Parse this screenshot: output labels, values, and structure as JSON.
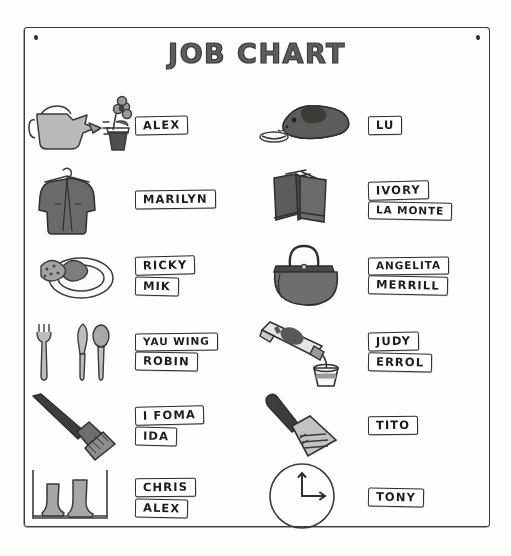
{
  "poster": {
    "title": "JOB CHART",
    "tack_left": "push-pin",
    "tack_right": "push-pin"
  },
  "rows": [
    {
      "side": "left",
      "job_icon": "watering-can-plant-icon",
      "job": "Water the plants",
      "names": [
        "ALEX"
      ]
    },
    {
      "side": "right",
      "job_icon": "guinea-pig-bowl-icon",
      "job": "Feed the class pet",
      "names": [
        "LU"
      ]
    },
    {
      "side": "left",
      "job_icon": "coat-hanger-icon",
      "job": "Coats and closet",
      "names": [
        "MARILYN"
      ]
    },
    {
      "side": "right",
      "job_icon": "books-icon",
      "job": "Library books",
      "names": [
        "IVORY",
        "LA MONTE"
      ]
    },
    {
      "side": "left",
      "job_icon": "plate-cookies-icon",
      "job": "Snack plates",
      "names": [
        "RICKY",
        "MIK"
      ]
    },
    {
      "side": "right",
      "job_icon": "handbag-icon",
      "job": "Dress-up corner",
      "names": [
        "ANGELITA",
        "MERRILL"
      ]
    },
    {
      "side": "left",
      "job_icon": "fork-knife-spoon-icon",
      "job": "Set the table",
      "names": [
        "YAU WING",
        "ROBIN"
      ]
    },
    {
      "side": "right",
      "job_icon": "paint-tube-cup-icon",
      "job": "Paint pots",
      "names": [
        "JUDY",
        "ERROL"
      ]
    },
    {
      "side": "left",
      "job_icon": "broom-icon",
      "job": "Sweeping",
      "names": [
        "I FOMA",
        "IDA"
      ]
    },
    {
      "side": "right",
      "job_icon": "dustpan-icon",
      "job": "Dustpan",
      "names": [
        "TITO"
      ]
    },
    {
      "side": "left",
      "job_icon": "rain-boots-icon",
      "job": "Boots and cubbies",
      "names": [
        "CHRIS",
        "ALEX"
      ]
    },
    {
      "side": "right",
      "job_icon": "clock-icon",
      "job": "Timekeeper",
      "names": [
        "TONY"
      ]
    }
  ],
  "colors": {
    "ink": "#2b2b29",
    "paper": "#fefefd",
    "wash_gray": "#9a9a98",
    "dark_gray": "#5a5a58",
    "mid_gray": "#787876"
  }
}
